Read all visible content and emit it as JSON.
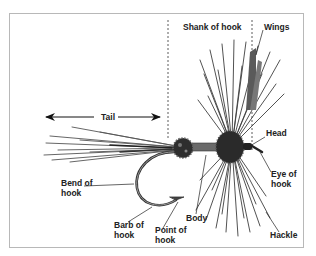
{
  "diagram": {
    "labels": {
      "shank": "Shank of hook",
      "wings": "Wings",
      "tail": "Tail",
      "head": "Head",
      "eye": {
        "line1": "Eye of",
        "line2": "hook"
      },
      "bend": {
        "line1": "Bend of",
        "line2": "hook"
      },
      "barb": {
        "line1": "Barb of",
        "line2": "hook"
      },
      "point": {
        "line1": "Point of",
        "line2": "hook"
      },
      "body": "Body",
      "hackle": "Hackle"
    },
    "colors": {
      "frame": "#b8b8b8",
      "ink": "#222222",
      "fiber": "#4a4a4a"
    }
  }
}
